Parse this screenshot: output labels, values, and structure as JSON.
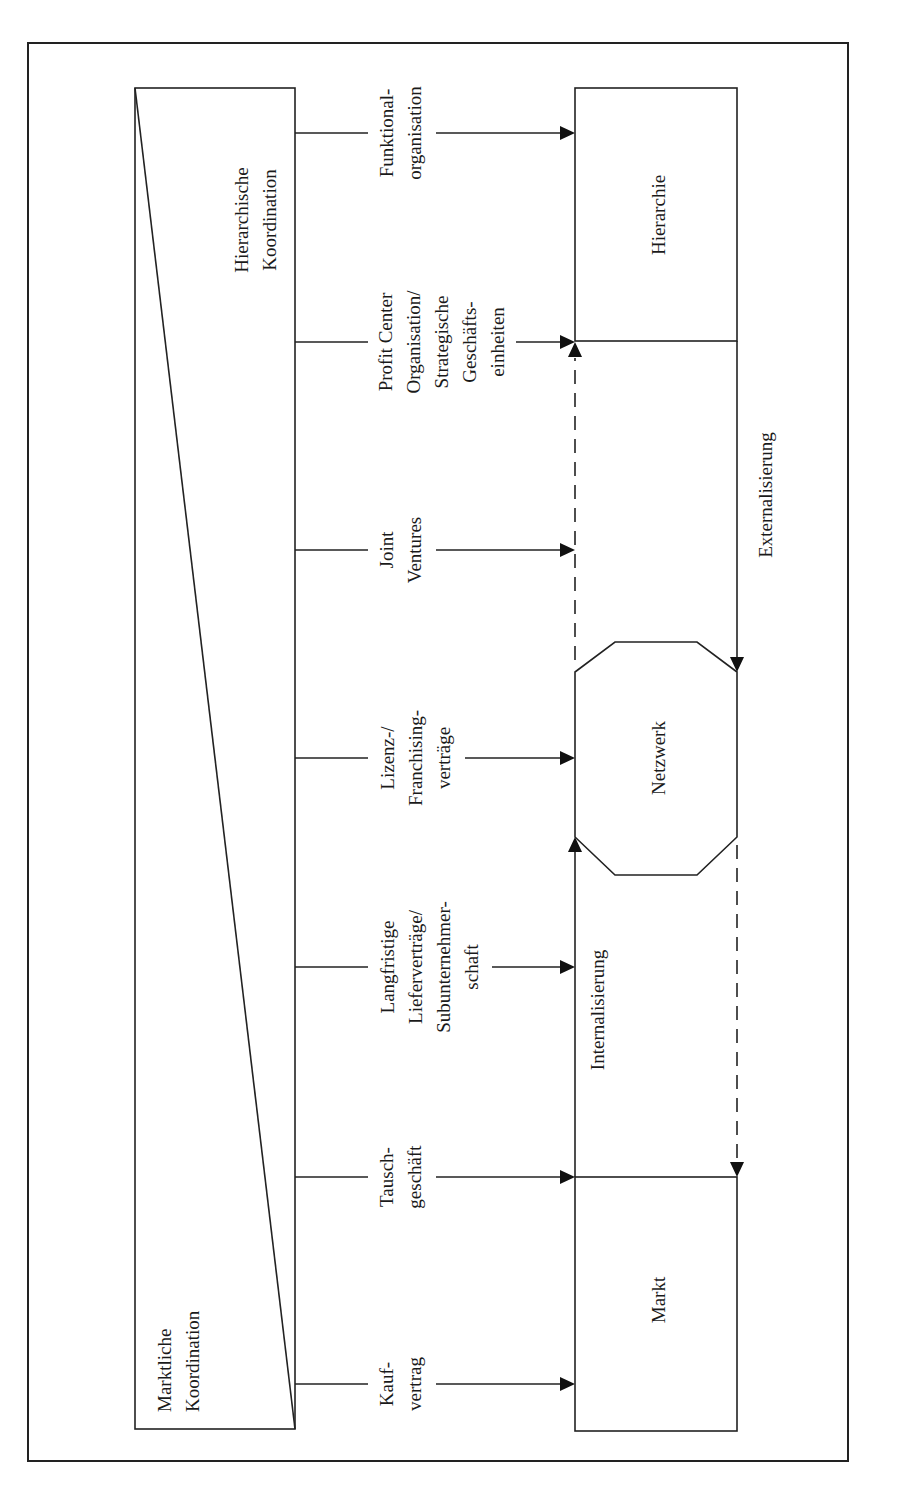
{
  "diagram": {
    "type": "flow-diagram",
    "orientation": "rotated-90-ccw",
    "coordination_wedge": {
      "top_label_line1": "Hierarchische",
      "top_label_line2": "Koordination",
      "bottom_label_line1": "Marktliche",
      "bottom_label_line2": "Koordination"
    },
    "forms": [
      {
        "lines": [
          "Funktional-",
          "organisation"
        ]
      },
      {
        "lines": [
          "Profit Center",
          "Organisation/",
          "Strategische",
          "Geschäfts-",
          "einheiten"
        ]
      },
      {
        "lines": [
          "Joint",
          "Ventures"
        ]
      },
      {
        "lines": [
          "Lizenz-/",
          "Franchising-",
          "verträge"
        ]
      },
      {
        "lines": [
          "Langfristige",
          "Lieferverträge/",
          "Subunternehmer-",
          "schaft"
        ]
      },
      {
        "lines": [
          "Tausch-",
          "geschäft"
        ]
      },
      {
        "lines": [
          "Kauf-",
          "vertrag"
        ]
      }
    ],
    "targets": {
      "hierarchy": "Hierarchie",
      "network": "Netzwerk",
      "market": "Markt"
    },
    "flows": {
      "externalization": "Externalisierung",
      "internalization": "Internalisierung"
    },
    "colors": {
      "line": "#222222",
      "background": "#ffffff"
    }
  }
}
